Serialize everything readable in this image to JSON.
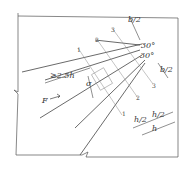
{
  "diagram": {
    "type": "technical-drawing",
    "labels": {
      "b_half_top": "b/2",
      "b_half_right": "b/2",
      "angle_1": "30°",
      "angle_2": "30°",
      "length_min": "≥2.5h",
      "sigma": "σ",
      "force": "F",
      "h_half_1": "h/2",
      "h_half_2": "h/2",
      "h": "h",
      "section_1_a": "1",
      "section_1_b": "1",
      "section_2_a": "2",
      "section_2_b": "2",
      "section_3_a": "3",
      "section_3_b": "3"
    }
  }
}
